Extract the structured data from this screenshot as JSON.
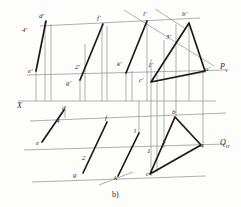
{
  "figure": {
    "caption": "b)",
    "axis_label": "X",
    "trace_v": "P",
    "trace_v_sub": "V",
    "trace_h": "Q",
    "trace_h_sub": "H",
    "colors": {
      "heavy_line": "#1a1a1a",
      "light_line": "#8d8d8d",
      "axis_line": "#8d8d8d",
      "label_text": "#2b2b2b",
      "background": "#fdfdfb"
    }
  },
  "labels_front_view": [
    {
      "text": "d'",
      "x": 39,
      "y": 16
    },
    {
      "text": "4'",
      "x": 23,
      "y": 30
    },
    {
      "text": "f'",
      "x": 97,
      "y": 18
    },
    {
      "text": "l'",
      "x": 143,
      "y": 14
    },
    {
      "text": "b'",
      "x": 182,
      "y": 14
    },
    {
      "text": "3'",
      "x": 166,
      "y": 37
    },
    {
      "text": "e'",
      "x": 29,
      "y": 71
    },
    {
      "text": "2'",
      "x": 76,
      "y": 67
    },
    {
      "text": "g'",
      "x": 66,
      "y": 83
    },
    {
      "text": "k'",
      "x": 117,
      "y": 64
    },
    {
      "text": "1'",
      "x": 149,
      "y": 65
    },
    {
      "text": "c'",
      "x": 140,
      "y": 80
    },
    {
      "text": "a'",
      "x": 205,
      "y": 68
    }
  ],
  "labels_top_view": [
    {
      "text": "d",
      "x": 61,
      "y": 108
    },
    {
      "text": "4",
      "x": 56,
      "y": 121
    },
    {
      "text": "f",
      "x": 105,
      "y": 118
    },
    {
      "text": "l",
      "x": 134,
      "y": 131
    },
    {
      "text": "b",
      "x": 172,
      "y": 112
    },
    {
      "text": "3",
      "x": 163,
      "y": 142
    },
    {
      "text": "e",
      "x": 37,
      "y": 143
    },
    {
      "text": "2",
      "x": 82,
      "y": 158
    },
    {
      "text": "g",
      "x": 73,
      "y": 175
    },
    {
      "text": "k",
      "x": 114,
      "y": 178
    },
    {
      "text": "1",
      "x": 148,
      "y": 151
    },
    {
      "text": "c",
      "x": 147,
      "y": 174
    },
    {
      "text": "a",
      "x": 200,
      "y": 145
    }
  ],
  "geometry": {
    "x_axis": {
      "y": 101,
      "x1": 18,
      "x2": 216
    },
    "pv_line": {
      "y": 72,
      "x1": 150,
      "x2": 224
    },
    "qh_line": {
      "y": 146,
      "x1": 150,
      "x2": 226
    },
    "triangle_front": [
      [
        151,
        82
      ],
      [
        189,
        22
      ],
      [
        206,
        72
      ]
    ],
    "triangle_top": [
      [
        150,
        174
      ],
      [
        175,
        116
      ],
      [
        201,
        145
      ]
    ],
    "segments_front": [
      [
        [
          36,
          70
        ],
        [
          45,
          21
        ]
      ],
      [
        [
          80,
          79
        ],
        [
          102,
          24
        ]
      ],
      [
        [
          126,
          72
        ],
        [
          147,
          21
        ]
      ]
    ],
    "segments_top": [
      [
        [
          42,
          141
        ],
        [
          65,
          110
        ]
      ],
      [
        [
          83,
          172
        ],
        [
          107,
          122
        ]
      ],
      [
        [
          118,
          175
        ],
        [
          139,
          133
        ]
      ]
    ]
  }
}
